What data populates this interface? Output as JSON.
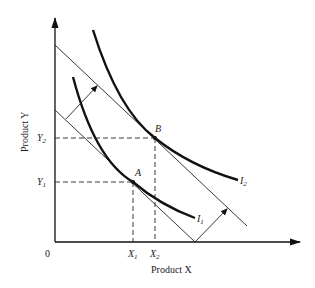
{
  "diagram": {
    "type": "indifference-curve-budget-line",
    "axes": {
      "x_label": "Product X",
      "y_label": "Product Y",
      "origin_label": "0"
    },
    "points": {
      "A": {
        "label": "A",
        "x_tick": "X",
        "x_sub": "1",
        "y_tick": "Y",
        "y_sub": "1"
      },
      "B": {
        "label": "B",
        "x_tick": "X",
        "x_sub": "2",
        "y_tick": "Y",
        "y_sub": "2"
      }
    },
    "curves": [
      {
        "label": "I",
        "sub": "1",
        "name": "indifference-curve-1"
      },
      {
        "label": "I",
        "sub": "2",
        "name": "indifference-curve-2"
      }
    ],
    "budget_lines": [
      {
        "name": "initial-budget-line"
      },
      {
        "name": "shifted-budget-line"
      }
    ],
    "shift_arrows": 2,
    "colors": {
      "ink": "#111111",
      "background": "#ffffff"
    }
  }
}
